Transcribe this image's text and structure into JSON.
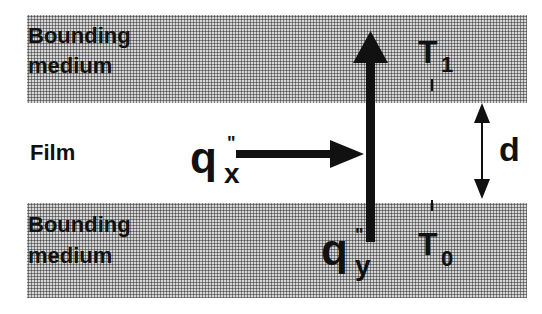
{
  "labels": {
    "top_medium_line1": "Bounding",
    "top_medium_line2": "medium",
    "film": "Film",
    "bottom_medium_line1": "Bounding",
    "bottom_medium_line2": "medium"
  },
  "symbols": {
    "qx": "q",
    "qx_sub": "x",
    "qy": "q",
    "qy_sub": "y",
    "prime": "\"",
    "T1": "T",
    "T1_sub": "1",
    "T0": "T",
    "T0_sub": "0",
    "thickness": "d"
  }
}
